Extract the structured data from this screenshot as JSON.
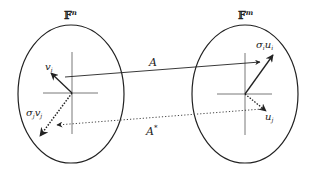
{
  "diagram": {
    "left_space": {
      "label": "𝔽",
      "superscript": "n",
      "vector_label": "v",
      "vector_sub": "i",
      "scaled_vector_label": "σ",
      "scaled_vector_sub1": "j",
      "scaled_vector_mid": "v",
      "scaled_vector_sub2": "j"
    },
    "right_space": {
      "label": "𝔽",
      "superscript": "m",
      "vector_label": "σ",
      "vector_sub1": "i",
      "vector_mid": "u",
      "vector_sub2": "i",
      "dotted_vector_label": "u",
      "dotted_vector_sub": "j"
    },
    "map_forward": {
      "label": "A"
    },
    "map_adjoint": {
      "label": "A",
      "superscript": "*"
    },
    "colors": {
      "stroke": "#222222",
      "background": "#ffffff"
    }
  }
}
